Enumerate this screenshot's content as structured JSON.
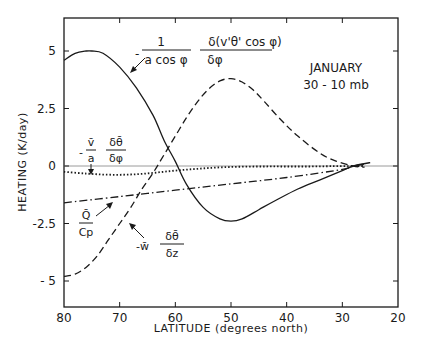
{
  "chart_data": {
    "type": "line",
    "title": "",
    "annotation_title": "JANUARY",
    "annotation_subtitle": "30 - 10 mb",
    "xlabel": "LATITUDE (degrees north)",
    "ylabel": "HEATING (K/day)",
    "xlim": [
      80,
      20
    ],
    "ylim": [
      -6.2,
      6.4
    ],
    "x_reversed": true,
    "x_ticks": [
      80,
      70,
      60,
      50,
      40,
      30,
      20
    ],
    "x_tick_labels": [
      "80",
      "70",
      "60",
      "50",
      "40",
      "30",
      "20"
    ],
    "y_ticks": [
      5,
      2.5,
      0,
      -2.5,
      -5
    ],
    "y_tick_labels": [
      "5",
      "2.5",
      "0",
      "-2.5",
      "- 5"
    ],
    "grid": false,
    "zero_line": true,
    "series": [
      {
        "name": "eddy heat flux convergence: -(1/(a cos φ)) δ(v'θ' cos φ)/δφ",
        "style": "solid",
        "x": [
          80,
          78,
          76,
          75,
          73,
          70,
          67,
          64,
          62,
          60,
          58,
          55,
          52,
          50,
          48,
          45,
          42,
          38,
          34,
          30,
          28,
          25
        ],
        "y": [
          4.6,
          4.9,
          5.0,
          5.0,
          4.9,
          4.3,
          3.4,
          2.2,
          1.1,
          0.2,
          -0.8,
          -1.8,
          -2.3,
          -2.4,
          -2.3,
          -1.9,
          -1.5,
          -1.0,
          -0.6,
          -0.2,
          0.0,
          0.15
        ]
      },
      {
        "name": "vertical advection: -w̄ δθ̄/δz",
        "style": "dashed",
        "x": [
          80,
          78,
          76,
          74,
          72,
          70,
          68,
          66,
          64,
          62,
          60,
          58,
          56,
          54,
          52,
          50,
          48,
          46,
          44,
          41,
          38,
          34,
          31,
          28,
          26
        ],
        "y": [
          -4.8,
          -4.7,
          -4.4,
          -3.9,
          -3.2,
          -2.5,
          -1.8,
          -1.0,
          -0.3,
          0.5,
          1.3,
          2.1,
          2.8,
          3.35,
          3.7,
          3.8,
          3.65,
          3.3,
          2.8,
          2.0,
          1.3,
          0.55,
          0.2,
          0.0,
          -0.05
        ]
      },
      {
        "name": "meridional advection: -(v̄/a) δθ̄/δφ",
        "style": "dotted",
        "x": [
          80,
          76,
          72,
          68,
          64,
          60,
          56,
          52,
          48,
          44,
          40,
          36,
          32,
          28,
          26
        ],
        "y": [
          -0.25,
          -0.33,
          -0.38,
          -0.37,
          -0.3,
          -0.2,
          -0.12,
          -0.06,
          -0.03,
          -0.02,
          -0.02,
          -0.02,
          -0.01,
          0.0,
          0.0
        ]
      },
      {
        "name": "diabatic heating: Q̄/Cp",
        "style": "dashdot",
        "x": [
          80,
          70,
          60,
          50,
          40,
          30,
          28,
          26
        ],
        "y": [
          -1.6,
          -1.33,
          -1.05,
          -0.78,
          -0.5,
          -0.15,
          0.0,
          0.08
        ]
      }
    ],
    "labels": [
      {
        "id": "eddy",
        "text_prefix": "-",
        "numerator": "1",
        "denominator": "a  cos φ",
        "numerator2": "δ(v'θ' cos φ)",
        "denominator2": "δφ"
      },
      {
        "id": "meridional",
        "text_prefix": "-",
        "numerator": "v̄",
        "denominator": "a",
        "numerator2": "δθ̄",
        "denominator2": "δφ"
      },
      {
        "id": "diabatic",
        "numerator": "Q̄",
        "denominator": "Cp"
      },
      {
        "id": "vertical",
        "text_prefix": "-w̄",
        "numerator2": "δθ̄",
        "denominator2": "δz"
      }
    ]
  }
}
